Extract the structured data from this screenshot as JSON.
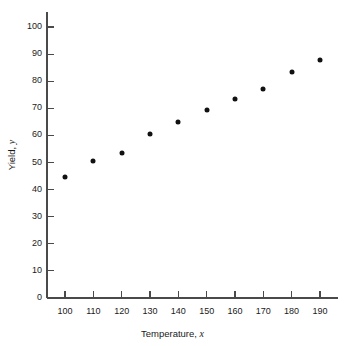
{
  "chart_data": {
    "type": "scatter",
    "title": "",
    "xlabel": "Temperature, x",
    "ylabel": "Yield, y",
    "xlabel_main": "Temperature,",
    "xlabel_var": "x",
    "ylabel_main": "Yield,",
    "ylabel_var": "y",
    "x": [
      100,
      110,
      120,
      130,
      140,
      150,
      160,
      170,
      180,
      190
    ],
    "y": [
      44.5,
      50.5,
      53.5,
      60.5,
      65,
      69.5,
      73.5,
      77,
      83.5,
      88
    ],
    "points": [
      {
        "x": 100,
        "y": 44.5
      },
      {
        "x": 110,
        "y": 50.5
      },
      {
        "x": 120,
        "y": 53.5
      },
      {
        "x": 130,
        "y": 60.5
      },
      {
        "x": 140,
        "y": 65
      },
      {
        "x": 150,
        "y": 69.5
      },
      {
        "x": 160,
        "y": 73.5
      },
      {
        "x": 170,
        "y": 77
      },
      {
        "x": 180,
        "y": 83.5
      },
      {
        "x": 190,
        "y": 88
      }
    ],
    "xlim": [
      93,
      197
    ],
    "ylim": [
      0,
      104
    ],
    "xticks": [
      100,
      110,
      120,
      130,
      140,
      150,
      160,
      170,
      180,
      190
    ],
    "yticks": [
      0,
      10,
      20,
      30,
      40,
      50,
      60,
      70,
      80,
      90,
      100
    ],
    "xtick_labels": [
      "100",
      "110",
      "120",
      "130",
      "140",
      "150",
      "160",
      "170",
      "180",
      "190"
    ],
    "ytick_labels": [
      "0",
      "10",
      "20",
      "30",
      "40",
      "50",
      "60",
      "70",
      "80",
      "90",
      "100"
    ],
    "grid": false,
    "legend": false,
    "marker": "filled-circle",
    "marker_color": "#111111",
    "axis_color": "#4a4a4a",
    "background": "#ffffff",
    "tick_direction": "in"
  }
}
